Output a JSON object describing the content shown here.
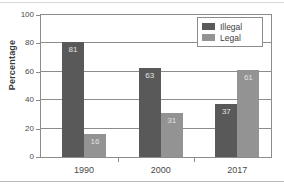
{
  "chart_data": {
    "type": "bar",
    "title": "",
    "xlabel": "",
    "ylabel": "Percentage",
    "categories": [
      "1990",
      "2000",
      "2017"
    ],
    "series": [
      {
        "name": "Illegal",
        "color": "#595959",
        "values": [
          81,
          63,
          37
        ]
      },
      {
        "name": "Legal",
        "color": "#939393",
        "values": [
          16,
          31,
          61
        ]
      }
    ],
    "ylim": [
      0,
      100
    ],
    "yticks": [
      0,
      20,
      40,
      60,
      80,
      100
    ],
    "ytick_labels": [
      "0",
      "20",
      "40",
      "60",
      "80",
      "100"
    ],
    "grid": true,
    "grid_axis": "y",
    "legend_position": "top-right",
    "data_labels": true
  },
  "legend": {
    "entries": [
      {
        "label": "Illegal"
      },
      {
        "label": "Legal"
      }
    ]
  }
}
